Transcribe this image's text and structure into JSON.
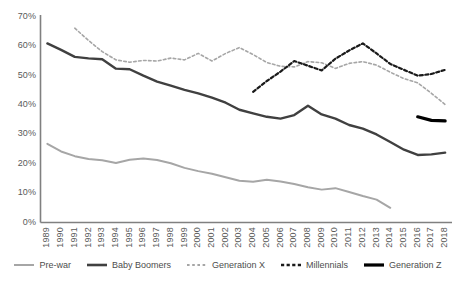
{
  "chart_data": {
    "type": "line",
    "title": "",
    "subtitle": "",
    "xlabel": "",
    "ylabel": "",
    "grid": false,
    "legend_position": "bottom",
    "ylim": [
      0,
      70
    ],
    "y_ticks": [
      0,
      10,
      20,
      30,
      40,
      50,
      60,
      70
    ],
    "y_tick_labels": [
      "0%",
      "10%",
      "20%",
      "30%",
      "40%",
      "50%",
      "60%",
      "70%"
    ],
    "categories": [
      "1989",
      "1990",
      "1991",
      "1992",
      "1993",
      "1994",
      "1995",
      "1996",
      "1997",
      "1998",
      "1999",
      "2000",
      "2001",
      "2002",
      "2003",
      "2004",
      "2005",
      "2006",
      "2007",
      "2008",
      "2009",
      "2010",
      "2011",
      "2012",
      "2013",
      "2014",
      "2015",
      "2016",
      "2017",
      "2018"
    ],
    "series": [
      {
        "name": "Pre-war",
        "style": "solid",
        "color": "#A6A6A6",
        "width": 2,
        "values": [
          26.8,
          24.2,
          22.6,
          21.6,
          21.2,
          20.3,
          21.4,
          21.8,
          21.3,
          20.2,
          18.6,
          17.5,
          16.6,
          15.4,
          14.2,
          13.9,
          14.6,
          14.0,
          13.1,
          12.0,
          11.2,
          11.7,
          10.4,
          9.0,
          7.8,
          5.0,
          null,
          null,
          null,
          null
        ]
      },
      {
        "name": "Baby Boomers",
        "style": "solid",
        "color": "#404040",
        "width": 2.4,
        "values": [
          61.0,
          58.8,
          56.4,
          55.9,
          55.6,
          52.4,
          52.2,
          50.0,
          48.0,
          46.6,
          45.2,
          44.0,
          42.5,
          40.8,
          38.4,
          37.2,
          36.0,
          35.4,
          36.6,
          39.8,
          36.8,
          35.4,
          33.2,
          32.0,
          30.0,
          27.4,
          24.8,
          23.0,
          23.2,
          23.8
        ]
      },
      {
        "name": "Generation X",
        "style": "dashed",
        "color": "#A6A6A6",
        "width": 1.6,
        "values": [
          null,
          null,
          66.2,
          62.0,
          58.2,
          55.4,
          54.6,
          55.2,
          55.0,
          56.0,
          55.4,
          57.6,
          55.0,
          57.6,
          59.6,
          57.2,
          54.5,
          53.2,
          53.0,
          54.8,
          54.4,
          52.5,
          54.2,
          54.8,
          53.6,
          51.2,
          49.0,
          47.6,
          44.0,
          40.2
        ]
      },
      {
        "name": "Millennials",
        "style": "dashed",
        "color": "#1a1a1a",
        "width": 2.2,
        "values": [
          null,
          null,
          null,
          null,
          null,
          null,
          null,
          null,
          null,
          null,
          null,
          null,
          null,
          null,
          null,
          44.5,
          48.2,
          51.4,
          55.0,
          53.4,
          51.8,
          55.8,
          58.6,
          61.0,
          57.6,
          54.0,
          52.0,
          50.0,
          50.6,
          52.0
        ]
      },
      {
        "name": "Generation Z",
        "style": "solid",
        "color": "#000000",
        "width": 3.2,
        "values": [
          null,
          null,
          null,
          null,
          null,
          null,
          null,
          null,
          null,
          null,
          null,
          null,
          null,
          null,
          null,
          null,
          null,
          null,
          null,
          null,
          null,
          null,
          null,
          null,
          null,
          null,
          null,
          36.0,
          34.8,
          34.6
        ]
      }
    ]
  },
  "axis": {
    "y_axis_name": "percent-axis",
    "x_axis_name": "year-axis"
  },
  "legend": {
    "items": [
      {
        "label": "Pre-war",
        "color": "#A6A6A6",
        "style": "solid",
        "width": 2
      },
      {
        "label": "Baby Boomers",
        "color": "#404040",
        "style": "solid",
        "width": 2.6
      },
      {
        "label": "Generation X",
        "color": "#A6A6A6",
        "style": "dashed",
        "width": 1.8
      },
      {
        "label": "Millennials",
        "color": "#1a1a1a",
        "style": "dashed",
        "width": 2.4
      },
      {
        "label": "Generation Z",
        "color": "#000000",
        "style": "solid",
        "width": 3.2
      }
    ]
  }
}
